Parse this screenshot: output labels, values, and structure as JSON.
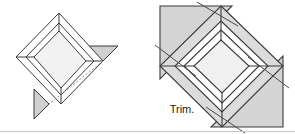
{
  "diagram": {
    "type": "geometry-construction-illustration",
    "canvas": {
      "width": 295,
      "height": 134,
      "background": "#ffffff"
    },
    "colors": {
      "outline": "#3a3a3a",
      "frame_fill": "#ffffff",
      "inner_panel_fill": "#f2f2f2",
      "triangle_fill": "#d0d0d0",
      "triangle_fill_light": "#d9d9d9",
      "dashed_guide": "#8a8a8a",
      "trim_line": "#4a4a4a",
      "bottom_rule": "#c8c8c8",
      "label_text": "#1a1a1a"
    },
    "labels": {
      "trim": "Trim."
    },
    "figures": [
      {
        "id": "figure-left",
        "name": "untrimmed-frame",
        "description": "Rotated square frame with two small shaded corner triangles and a dashed alignment guide",
        "has_trim_label": false,
        "triangle_count": 2,
        "dashed_guide": true
      },
      {
        "id": "figure-right",
        "name": "trimmed-frame",
        "description": "Rotated square frame with two large shaded corner triangles and crossing trim lines marked Trim.",
        "has_trim_label": true,
        "triangle_count": 2,
        "trim_lines": 4
      }
    ]
  }
}
